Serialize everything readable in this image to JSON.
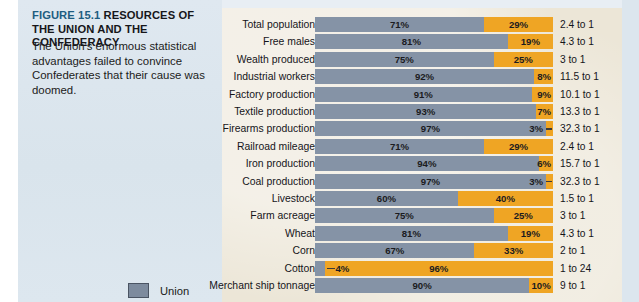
{
  "figure": {
    "number": "FIGURE 15.1",
    "title": "RESOURCES OF THE UNION AND THE CONFEDERACY",
    "caption": "The Union's enormous statistical advantages failed to convince Confederates that their cause was doomed."
  },
  "legend": {
    "items": [
      {
        "label": "Union",
        "color": "#7d8b9e"
      }
    ]
  },
  "colors": {
    "union_bar": "#8593a6",
    "confederacy_bar": "#efa524",
    "left_panel_bg": "#dde7ef",
    "chart_panel_bg": "#ece6d7",
    "figure_number": "#1d5c80"
  },
  "chart_data": {
    "type": "bar",
    "subtype": "100% stacked horizontal bar",
    "title": "RESOURCES OF THE UNION AND THE CONFEDERACY",
    "xlabel": "",
    "ylabel": "",
    "xlim": [
      0,
      100
    ],
    "grid": false,
    "legend_position": "bottom-left",
    "categories": [
      "Total population",
      "Free males",
      "Wealth produced",
      "Industrial workers",
      "Factory production",
      "Textile production",
      "Firearms production",
      "Railroad mileage",
      "Iron production",
      "Coal production",
      "Livestock",
      "Farm acreage",
      "Wheat",
      "Corn",
      "Cotton",
      "Merchant ship tonnage"
    ],
    "series": [
      {
        "name": "Union",
        "color": "#8593a6",
        "values": [
          71,
          81,
          75,
          92,
          91,
          93,
          97,
          71,
          94,
          97,
          60,
          75,
          81,
          67,
          4,
          90
        ]
      },
      {
        "name": "Confederacy",
        "color": "#efa524",
        "values": [
          29,
          19,
          25,
          8,
          9,
          7,
          3,
          29,
          6,
          3,
          40,
          25,
          19,
          33,
          96,
          10
        ]
      }
    ],
    "ratios": [
      "2.4 to 1",
      "4.3 to 1",
      "3 to 1",
      "11.5 to 1",
      "10.1 to 1",
      "13.3 to 1",
      "32.3 to 1",
      "2.4 to 1",
      "15.7 to 1",
      "32.3 to 1",
      "1.5 to 1",
      "3 to 1",
      "4.3 to 1",
      "2 to 1",
      "1 to 24",
      "9 to 1"
    ],
    "rows": [
      {
        "label": "Total population",
        "union": 71,
        "union_text": "71%",
        "conf": 29,
        "conf_text": "29%",
        "ratio": "2.4 to 1",
        "union_label_outside": false,
        "conf_label_outside": false
      },
      {
        "label": "Free males",
        "union": 81,
        "union_text": "81%",
        "conf": 19,
        "conf_text": "19%",
        "ratio": "4.3 to 1",
        "union_label_outside": false,
        "conf_label_outside": false
      },
      {
        "label": "Wealth produced",
        "union": 75,
        "union_text": "75%",
        "conf": 25,
        "conf_text": "25%",
        "ratio": "3 to 1",
        "union_label_outside": false,
        "conf_label_outside": false
      },
      {
        "label": "Industrial workers",
        "union": 92,
        "union_text": "92%",
        "conf": 8,
        "conf_text": "8%",
        "ratio": "11.5 to 1",
        "union_label_outside": false,
        "conf_label_outside": true
      },
      {
        "label": "Factory production",
        "union": 91,
        "union_text": "91%",
        "conf": 9,
        "conf_text": "9%",
        "ratio": "10.1 to 1",
        "union_label_outside": false,
        "conf_label_outside": true
      },
      {
        "label": "Textile production",
        "union": 93,
        "union_text": "93%",
        "conf": 7,
        "conf_text": "7%",
        "ratio": "13.3 to 1",
        "union_label_outside": false,
        "conf_label_outside": true
      },
      {
        "label": "Firearms production",
        "union": 97,
        "union_text": "97%",
        "conf": 3,
        "conf_text": "3%",
        "ratio": "32.3 to 1",
        "union_label_outside": false,
        "conf_label_outside": true,
        "conf_leader": true
      },
      {
        "label": "Railroad mileage",
        "union": 71,
        "union_text": "71%",
        "conf": 29,
        "conf_text": "29%",
        "ratio": "2.4 to 1",
        "union_label_outside": false,
        "conf_label_outside": false
      },
      {
        "label": "Iron production",
        "union": 94,
        "union_text": "94%",
        "conf": 6,
        "conf_text": "6%",
        "ratio": "15.7 to 1",
        "union_label_outside": false,
        "conf_label_outside": true
      },
      {
        "label": "Coal production",
        "union": 97,
        "union_text": "97%",
        "conf": 3,
        "conf_text": "3%",
        "ratio": "32.3 to 1",
        "union_label_outside": false,
        "conf_label_outside": true,
        "conf_leader": true
      },
      {
        "label": "Livestock",
        "union": 60,
        "union_text": "60%",
        "conf": 40,
        "conf_text": "40%",
        "ratio": "1.5 to 1",
        "union_label_outside": false,
        "conf_label_outside": false
      },
      {
        "label": "Farm acreage",
        "union": 75,
        "union_text": "75%",
        "conf": 25,
        "conf_text": "25%",
        "ratio": "3 to 1",
        "union_label_outside": false,
        "conf_label_outside": false
      },
      {
        "label": "Wheat",
        "union": 81,
        "union_text": "81%",
        "conf": 19,
        "conf_text": "19%",
        "ratio": "4.3 to 1",
        "union_label_outside": false,
        "conf_label_outside": false
      },
      {
        "label": "Corn",
        "union": 67,
        "union_text": "67%",
        "conf": 33,
        "conf_text": "33%",
        "ratio": "2 to 1",
        "union_label_outside": false,
        "conf_label_outside": false
      },
      {
        "label": "Cotton",
        "union": 4,
        "union_text": "4%",
        "conf": 96,
        "conf_text": "96%",
        "ratio": "1 to 24",
        "union_label_outside": true,
        "union_leader": true,
        "conf_label_outside": false
      },
      {
        "label": "Merchant ship tonnage",
        "union": 90,
        "union_text": "90%",
        "conf": 10,
        "conf_text": "10%",
        "ratio": "9 to 1",
        "union_label_outside": false,
        "conf_label_outside": false
      }
    ]
  }
}
